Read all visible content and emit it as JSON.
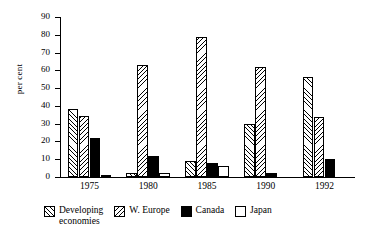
{
  "chart_data": {
    "type": "bar",
    "title": "",
    "xlabel": "",
    "ylabel": "per cent",
    "ylim": [
      0,
      90
    ],
    "yticks": [
      0,
      10,
      20,
      30,
      40,
      50,
      60,
      70,
      80,
      90
    ],
    "grid": false,
    "legend_position": "bottom",
    "categories": [
      "1975",
      "1980",
      "1985",
      "1990",
      "1992"
    ],
    "series": [
      {
        "name": "Developing\neconomies",
        "pattern": "backslash-hatch",
        "values": [
          38,
          2,
          9,
          30,
          56
        ]
      },
      {
        "name": "W. Europe",
        "pattern": "forwardslash-hatch",
        "values": [
          34.5,
          63,
          79,
          62,
          34
        ]
      },
      {
        "name": "Canada",
        "pattern": "solid-black",
        "values": [
          22,
          12,
          8,
          2,
          10
        ]
      },
      {
        "name": "Japan",
        "pattern": "white-open",
        "values": [
          1,
          2,
          6,
          0,
          0
        ]
      }
    ]
  },
  "legend": {
    "items": [
      {
        "label": "Developing\neconomies",
        "swatch": "backslash-hatch"
      },
      {
        "label": "W. Europe",
        "swatch": "forwardslash-hatch"
      },
      {
        "label": "Canada",
        "swatch": "solid-black"
      },
      {
        "label": "Japan",
        "swatch": "white-open"
      }
    ]
  }
}
